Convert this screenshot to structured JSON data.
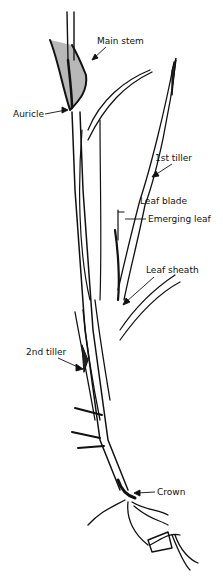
{
  "diagram": {
    "colors": {
      "ink": "#111111",
      "background": "#ffffff"
    },
    "labels": [
      {
        "id": "main-stem",
        "text": "Main stem",
        "x": 97,
        "y": 36
      },
      {
        "id": "auricle",
        "text": "Auricle",
        "x": 13,
        "y": 109
      },
      {
        "id": "first-tiller",
        "text": "1st tiller",
        "x": 155,
        "y": 153
      },
      {
        "id": "leaf-blade",
        "text": "Leaf blade",
        "x": 140,
        "y": 196
      },
      {
        "id": "emerging-leaf",
        "text": "Emerging leaf",
        "x": 148,
        "y": 214
      },
      {
        "id": "leaf-sheath",
        "text": "Leaf sheath",
        "x": 146,
        "y": 265
      },
      {
        "id": "second-tiller",
        "text": "2nd tiller",
        "x": 26,
        "y": 347
      },
      {
        "id": "crown",
        "text": "Crown",
        "x": 157,
        "y": 487
      }
    ]
  }
}
